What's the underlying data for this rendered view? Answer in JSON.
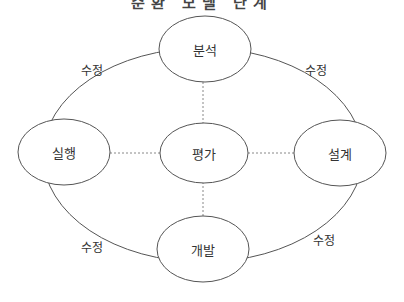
{
  "title": "순환 모델 단계",
  "nodes": {
    "top": {
      "label": "분석"
    },
    "left": {
      "label": "실행"
    },
    "center": {
      "label": "평가"
    },
    "right": {
      "label": "설계"
    },
    "bottom": {
      "label": "개발"
    }
  },
  "edge_labels": {
    "top_left": "수정",
    "top_right": "수정",
    "bottom_left": "수정",
    "bottom_right": "수정"
  },
  "colors": {
    "stroke": "#555555",
    "dashed": "#888888",
    "text": "#333333"
  }
}
